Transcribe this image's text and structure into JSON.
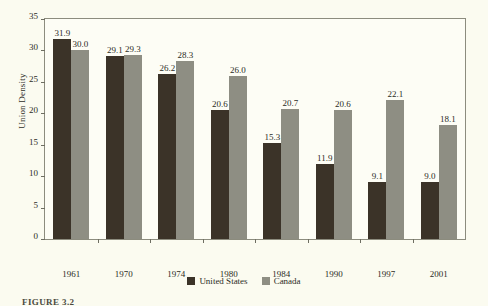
{
  "chart_data": {
    "type": "bar",
    "title": "",
    "xlabel": "",
    "ylabel": "Union Density",
    "ylim": [
      0,
      35
    ],
    "yticks": [
      0,
      5,
      10,
      15,
      20,
      25,
      30,
      35
    ],
    "grid": false,
    "legend_position": "bottom-center",
    "categories": [
      "1961",
      "1970",
      "1974",
      "1980",
      "1984",
      "1990",
      "1997",
      "2001"
    ],
    "series": [
      {
        "name": "United States",
        "color": "#3b3328",
        "values": [
          31.9,
          29.1,
          26.2,
          20.6,
          15.3,
          11.9,
          9.1,
          9.0
        ],
        "labels": [
          "31.9",
          "29.1",
          "26.2",
          "20.6",
          "15.3",
          "11.9",
          "9.1",
          "9.0"
        ]
      },
      {
        "name": "Canada",
        "color": "#8e8e83",
        "values": [
          30.0,
          29.3,
          28.3,
          26.0,
          20.7,
          20.6,
          22.1,
          18.1
        ],
        "labels": [
          "30.0",
          "29.3",
          "28.3",
          "26.0",
          "20.7",
          "20.6",
          "22.1",
          "18.1"
        ]
      }
    ]
  },
  "legend": {
    "entries": [
      {
        "label": "United States",
        "color": "#3b3328"
      },
      {
        "label": "Canada",
        "color": "#8e8e83"
      }
    ]
  },
  "caption": {
    "text": "FIGURE 3.2"
  }
}
